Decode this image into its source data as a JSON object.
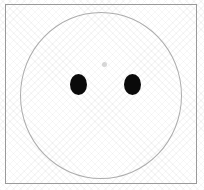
{
  "figure": {
    "title": "two black dots inside a circle outline",
    "canvas": {
      "width": 204,
      "height": 190,
      "background_color": "#ffffff",
      "texture": "diagonal-crosshatch"
    },
    "frame": {
      "name": "rectangular-frame",
      "stroke_color": "#9a9a9a",
      "stroke_width": 1,
      "x": 5,
      "y": 4,
      "width": 192,
      "height": 180
    },
    "circle": {
      "name": "large-circle-outline",
      "stroke_color": "#adadad",
      "stroke_width": 1,
      "fill": "none",
      "center_x": 101,
      "center_y": 95,
      "radius_x": 81,
      "radius_y": 83
    },
    "dots": [
      {
        "name": "left-dot",
        "fill_color": "#0a0a0a",
        "center_x": 78,
        "center_y": 85,
        "radius_x": 8,
        "radius_y": 10
      },
      {
        "name": "right-dot",
        "fill_color": "#0a0a0a",
        "center_x": 132,
        "center_y": 85,
        "radius_x": 8,
        "radius_y": 10
      }
    ],
    "faint_mark": {
      "name": "faint-center-smudge",
      "fill_color": "#969696",
      "center_x": 105,
      "center_y": 65,
      "radius": 3
    }
  }
}
